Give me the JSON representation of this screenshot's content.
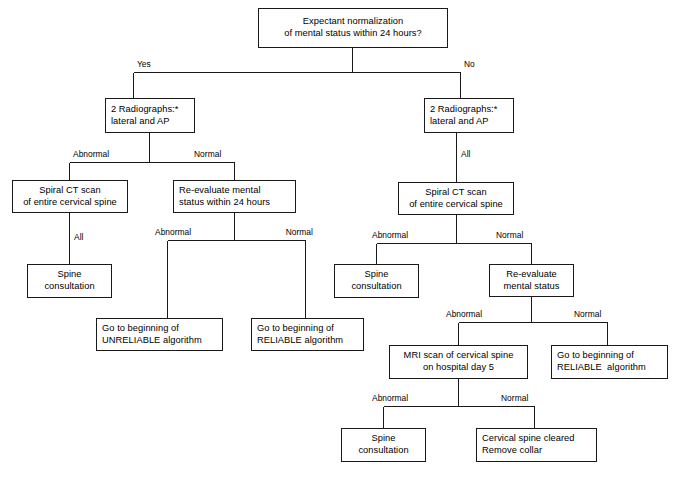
{
  "diagram": {
    "title_visible": false,
    "background_color": "#ffffff",
    "line_color": "#1a1a1a",
    "text_color": "#000000",
    "nodes": [
      {
        "id": "root",
        "name": "node-expectant-normalization",
        "lines": [
          "Expectant normalization",
          "of mental status within 24 hours?"
        ],
        "align": "center"
      },
      {
        "id": "rad_left",
        "name": "node-radiographs-left",
        "lines": [
          "2 Radiographs:*",
          "lateral and AP"
        ],
        "align": "left"
      },
      {
        "id": "rad_right",
        "name": "node-radiographs-right",
        "lines": [
          "2 Radiographs:*",
          "lateral and AP"
        ],
        "align": "left"
      },
      {
        "id": "ct_left",
        "name": "node-spiral-ct-left",
        "lines": [
          "Spiral CT scan",
          "of entire cervical spine"
        ],
        "align": "center"
      },
      {
        "id": "reeval_24",
        "name": "node-reevaluate-mental-status-24-hours",
        "lines": [
          "Re-evaluate mental",
          "status within 24 hours"
        ],
        "align": "left"
      },
      {
        "id": "spine_1",
        "name": "node-spine-consultation-left",
        "lines": [
          "Spine",
          "consultation"
        ],
        "align": "center"
      },
      {
        "id": "unreliable",
        "name": "node-go-to-unreliable-algorithm",
        "lines": [
          "Go to beginning of",
          "UNRELIABLE algorithm"
        ],
        "align": "left"
      },
      {
        "id": "reliable_1",
        "name": "node-go-to-reliable-algorithm-left",
        "lines": [
          "Go to beginning of",
          "RELIABLE algorithm"
        ],
        "align": "left"
      },
      {
        "id": "ct_right",
        "name": "node-spiral-ct-right",
        "lines": [
          "Spiral CT scan",
          "of entire cervical spine"
        ],
        "align": "center"
      },
      {
        "id": "spine_2",
        "name": "node-spine-consultation-middle",
        "lines": [
          "Spine",
          "consultation"
        ],
        "align": "center"
      },
      {
        "id": "reeval_ms",
        "name": "node-reevaluate-mental-status",
        "lines": [
          "Re-evaluate",
          "mental status"
        ],
        "align": "center"
      },
      {
        "id": "mri",
        "name": "node-mri-scan-cervical-spine",
        "lines": [
          "MRI scan of cervical spine",
          "on hospital day 5"
        ],
        "align": "center"
      },
      {
        "id": "reliable_2",
        "name": "node-go-to-reliable-algorithm-right",
        "lines": [
          "Go to beginning of",
          "RELIABLE  algorithm"
        ],
        "align": "left"
      },
      {
        "id": "spine_3",
        "name": "node-spine-consultation-bottom",
        "lines": [
          "Spine",
          "consultation"
        ],
        "align": "center"
      },
      {
        "id": "cleared",
        "name": "node-cervical-spine-cleared",
        "lines": [
          "Cervical spine cleared",
          "Remove collar"
        ],
        "align": "left"
      }
    ],
    "edge_labels": [
      {
        "id": "yes_root",
        "name": "edge-label-yes",
        "text": "Yes"
      },
      {
        "id": "no_root",
        "name": "edge-label-no",
        "text": "No"
      },
      {
        "id": "abn_radleft",
        "name": "edge-label-abnormal-rad-left",
        "text": "Abnormal"
      },
      {
        "id": "nor_radleft",
        "name": "edge-label-normal-rad-left",
        "text": "Normal"
      },
      {
        "id": "all_radright",
        "name": "edge-label-all-rad-right",
        "text": "All"
      },
      {
        "id": "all_ctleft",
        "name": "edge-label-all-ct-left",
        "text": "All"
      },
      {
        "id": "abn_reeval24",
        "name": "edge-label-abnormal-reeval-24",
        "text": "Abnormal"
      },
      {
        "id": "nor_reeval24",
        "name": "edge-label-normal-reeval-24",
        "text": "Normal"
      },
      {
        "id": "abn_ctright",
        "name": "edge-label-abnormal-ct-right",
        "text": "Abnormal"
      },
      {
        "id": "nor_ctright",
        "name": "edge-label-normal-ct-right",
        "text": "Normal"
      },
      {
        "id": "abn_reevalms",
        "name": "edge-label-abnormal-reeval-ms",
        "text": "Abnormal"
      },
      {
        "id": "nor_reevalms",
        "name": "edge-label-normal-reeval-ms",
        "text": "Normal"
      },
      {
        "id": "abn_mri",
        "name": "edge-label-abnormal-mri",
        "text": "Abnormal"
      },
      {
        "id": "nor_mri",
        "name": "edge-label-normal-mri",
        "text": "Normal"
      }
    ]
  }
}
